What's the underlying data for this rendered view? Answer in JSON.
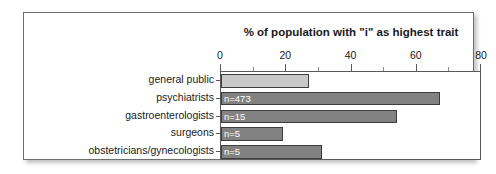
{
  "chart_data": {
    "type": "bar",
    "orientation": "horizontal",
    "title": "% of population with \"i\" as highest trait",
    "xlabel": "",
    "ylabel": "",
    "xlim": [
      0,
      80
    ],
    "xticks": [
      0,
      20,
      40,
      60,
      80
    ],
    "xtick_labels": [
      "0",
      "20",
      "40",
      "60",
      "80"
    ],
    "grid": false,
    "legend": "none",
    "categories": [
      "general public",
      "psychiatrists",
      "gastroenterologists",
      "surgeons",
      "obstetricians/gynecologists"
    ],
    "values": [
      27,
      67,
      54,
      19,
      31
    ],
    "annotations": [
      "",
      "n=473",
      "n=15",
      "n=5",
      "n=5"
    ],
    "bar_colors": [
      "#c9c9c9",
      "#828282",
      "#828282",
      "#828282",
      "#828282"
    ],
    "bar_edge_color": "#3d3d3d",
    "annotation_color": "#ffffff"
  },
  "frame": {
    "border_color": "#6e6e6e",
    "background": "#ffffff"
  }
}
